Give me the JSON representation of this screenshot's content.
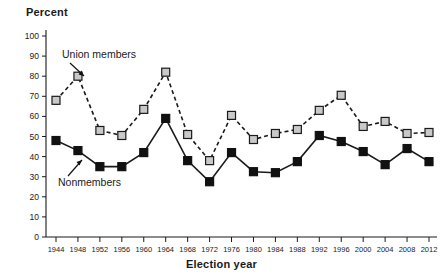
{
  "chart_data": {
    "type": "line",
    "title": "",
    "xlabel": "Election year",
    "ylabel": "Percent",
    "ylim": [
      0,
      100
    ],
    "ytick_step": 10,
    "yticks": [
      0,
      10,
      20,
      30,
      40,
      50,
      60,
      70,
      80,
      90,
      100
    ],
    "grid": false,
    "legend_position": "inline-annotations",
    "categories": [
      1944,
      1948,
      1952,
      1956,
      1960,
      1964,
      1968,
      1972,
      1976,
      1980,
      1984,
      1988,
      1992,
      1996,
      2000,
      2004,
      2008,
      2012
    ],
    "xtick_labels": [
      "1944",
      "1948",
      "1952",
      "1956",
      "1960",
      "1964",
      "1968",
      "1972",
      "1976",
      "1980",
      "1984",
      "1988",
      "1992",
      "1996",
      "2000",
      "2004",
      "2008",
      "2012"
    ],
    "series": [
      {
        "name": "Union members",
        "marker": "square",
        "marker_fill": "#c9c9c9",
        "marker_edge": "#1a1a1a",
        "line_style": "dashed",
        "line_color": "#1a1a1a",
        "values": [
          68,
          80,
          53,
          50.5,
          63.5,
          82,
          51,
          38,
          60.5,
          48.5,
          51.5,
          53.5,
          63,
          70.5,
          55,
          57.5,
          51.5,
          52
        ]
      },
      {
        "name": "Nonmembers",
        "marker": "square",
        "marker_fill": "#111111",
        "marker_edge": "#111111",
        "line_style": "solid",
        "line_color": "#1a1a1a",
        "values": [
          48,
          43,
          35,
          35,
          42,
          59,
          38,
          27.5,
          42,
          32.5,
          32,
          37.5,
          50.5,
          47.5,
          42.5,
          36,
          44,
          37.5
        ]
      }
    ],
    "annotations": [
      {
        "text": "Union members",
        "target_series": "Union members",
        "target_index": 1
      },
      {
        "text": "Nonmembers",
        "target_series": "Nonmembers",
        "target_index": 2
      }
    ]
  }
}
